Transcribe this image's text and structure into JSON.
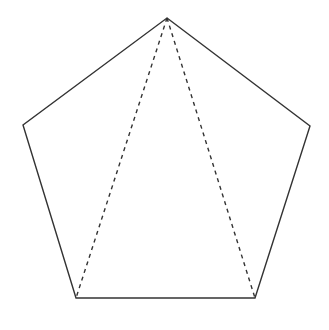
{
  "diagram": {
    "title": "",
    "shape": "regular-pentagon",
    "stroke_color": "#333333",
    "background": "#ffffff",
    "vertices": {
      "top": [
        167,
        18
      ],
      "right": [
        310,
        126
      ],
      "bottom_right": [
        255,
        298
      ],
      "bottom_left": [
        76,
        298
      ],
      "left": [
        23,
        125
      ]
    },
    "edges": [
      {
        "from": "top",
        "to": "right",
        "style": "solid"
      },
      {
        "from": "right",
        "to": "bottom_right",
        "style": "solid"
      },
      {
        "from": "bottom_right",
        "to": "bottom_left",
        "style": "solid"
      },
      {
        "from": "bottom_left",
        "to": "left",
        "style": "solid"
      },
      {
        "from": "left",
        "to": "top",
        "style": "solid"
      }
    ],
    "diagonals": [
      {
        "from": "top",
        "to": "bottom_left",
        "style": "dashed"
      },
      {
        "from": "top",
        "to": "bottom_right",
        "style": "dashed"
      }
    ]
  }
}
